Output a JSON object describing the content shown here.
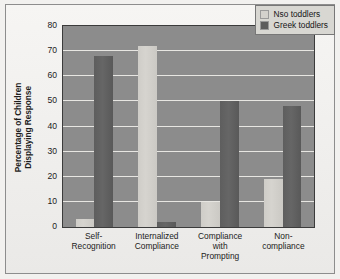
{
  "chart_data": {
    "type": "bar",
    "title": "",
    "subtitle": "",
    "xlabel": "",
    "ylabel": "Percentage of Children Displaying Response",
    "ylabel_lines": [
      "Percentage of Children",
      "Displaying Response"
    ],
    "categories": [
      "Self-Recognition",
      "Internalized Compliance",
      "Compliance with Prompting",
      "Non-compliance"
    ],
    "category_lines": [
      [
        "Self-",
        "Recognition"
      ],
      [
        "Internalized",
        "Compliance"
      ],
      [
        "Compliance",
        "with",
        "Prompting"
      ],
      [
        "Non-",
        "compliance"
      ]
    ],
    "series": [
      {
        "name": "Nso toddlers",
        "color": "#d3d1cc",
        "values": [
          3,
          72,
          10,
          19
        ]
      },
      {
        "name": "Greek toddlers",
        "color": "#5d5d5d",
        "values": [
          68,
          2,
          50,
          48
        ]
      }
    ],
    "ylim": [
      0,
      80
    ],
    "yticks": [
      0,
      10,
      20,
      30,
      40,
      50,
      60,
      70,
      80
    ],
    "ytick_labels": [
      "0",
      "10",
      "20",
      "30",
      "40",
      "50",
      "60",
      "70",
      "80"
    ],
    "grid": true,
    "grid_axis": "y",
    "legend_position": "top-right",
    "plot_background": "#8c8c8c",
    "gridline_color": "#e7e6e2",
    "figure_background": "#f2f1ef"
  },
  "legend": {
    "entries": [
      {
        "label": "Nso toddlers",
        "swatch": "nso"
      },
      {
        "label": "Greek toddlers",
        "swatch": "greek"
      }
    ]
  }
}
